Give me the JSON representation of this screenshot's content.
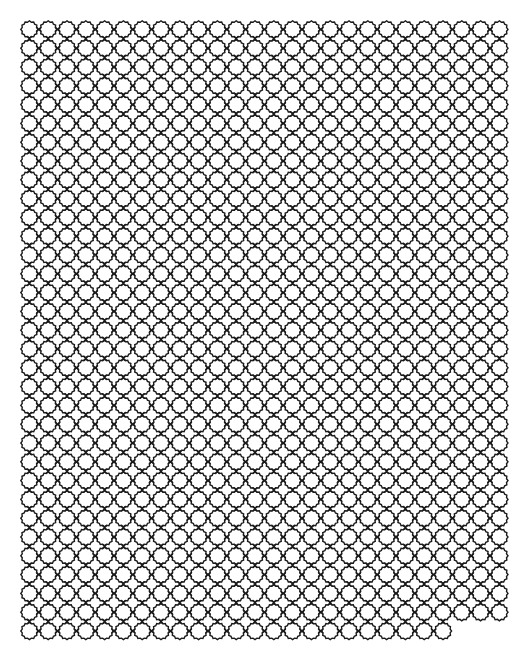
{
  "page": {
    "background": "#ffffff",
    "caption_top": ""
  },
  "pattern": {
    "name": "scalloped-ring-lattice",
    "stroke_color": "#1a1a1a",
    "stroke_width": 1.4,
    "origin_x": 20,
    "origin_y": 20,
    "pitch_x": 18.8,
    "pitch_y": 18.8,
    "ring_radius": 8.6,
    "scallops": 12,
    "rows": 33,
    "columns": 26,
    "last_row_columns": 23
  }
}
